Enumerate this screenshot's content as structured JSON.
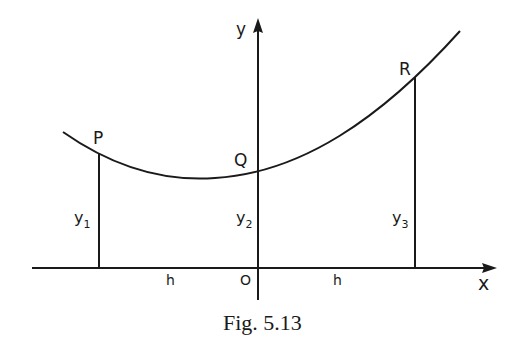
{
  "figure": {
    "caption": "Fig. 5.13",
    "axes": {
      "x_label": "x",
      "y_label": "y",
      "origin_label": "O"
    },
    "points": [
      {
        "name": "P",
        "ordinate_label": "y",
        "ordinate_sub": "1"
      },
      {
        "name": "Q",
        "ordinate_label": "y",
        "ordinate_sub": "2"
      },
      {
        "name": "R",
        "ordinate_label": "y",
        "ordinate_sub": "3"
      }
    ],
    "intervals": [
      {
        "label": "h"
      },
      {
        "label": "h"
      }
    ],
    "colors": {
      "ink": "#1a1a1a",
      "background": "#ffffff"
    }
  }
}
